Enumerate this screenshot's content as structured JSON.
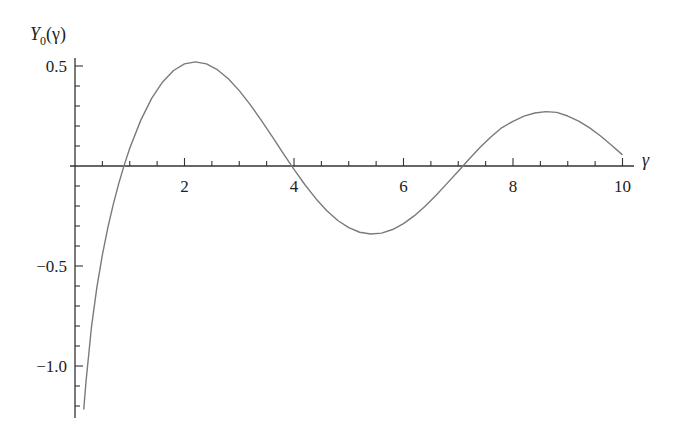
{
  "chart_data": {
    "type": "line",
    "title": "",
    "xlabel": "γ",
    "ylabel": "Y0(γ)",
    "ylabel_parts": {
      "base": "Y",
      "sub": "0",
      "arg": "(γ)"
    },
    "xlim": [
      0,
      10.2
    ],
    "ylim": [
      -1.25,
      0.55
    ],
    "x_ticks": [
      2,
      4,
      6,
      8,
      10
    ],
    "x_tick_labels": [
      "2",
      "4",
      "6",
      "8",
      "10"
    ],
    "y_ticks": [
      0.5,
      -0.5,
      -1.0
    ],
    "y_tick_labels": [
      "0.5",
      "−0.5",
      "−1.0"
    ],
    "x_minor_step": 0.5,
    "y_minor_step": 0.1,
    "grid": false,
    "line_color": "#7a7a7a",
    "axis_color": "#333333",
    "series": [
      {
        "name": "Y0(γ)",
        "x": [
          0.16,
          0.2,
          0.3,
          0.4,
          0.5,
          0.6,
          0.7,
          0.8,
          0.9,
          1.0,
          1.2,
          1.4,
          1.6,
          1.8,
          2.0,
          2.2,
          2.4,
          2.6,
          2.8,
          3.0,
          3.2,
          3.4,
          3.6,
          3.8,
          4.0,
          4.2,
          4.4,
          4.6,
          4.8,
          5.0,
          5.2,
          5.4,
          5.6,
          5.8,
          6.0,
          6.2,
          6.4,
          6.6,
          6.8,
          7.0,
          7.2,
          7.4,
          7.6,
          7.8,
          8.0,
          8.2,
          8.4,
          8.6,
          8.8,
          9.0,
          9.2,
          9.4,
          9.6,
          9.8,
          10.0
        ],
        "values": [
          -1.2175,
          -1.0811,
          -0.8073,
          -0.606,
          -0.4445,
          -0.3085,
          -0.1907,
          -0.0868,
          0.0056,
          0.0883,
          0.2281,
          0.3379,
          0.4204,
          0.4774,
          0.5104,
          0.5208,
          0.5104,
          0.4813,
          0.4359,
          0.3769,
          0.3071,
          0.2296,
          0.1477,
          0.0645,
          -0.0169,
          -0.0938,
          -0.1633,
          -0.2235,
          -0.2723,
          -0.3085,
          -0.3312,
          -0.3402,
          -0.3354,
          -0.3177,
          -0.2882,
          -0.2483,
          -0.1999,
          -0.1449,
          -0.0856,
          -0.0259,
          0.0352,
          0.0935,
          0.1464,
          0.1924,
          0.2235,
          0.2494,
          0.2651,
          0.2718,
          0.2679,
          0.2499,
          0.2245,
          0.1907,
          0.1498,
          0.1036,
          0.0557
        ]
      }
    ]
  }
}
